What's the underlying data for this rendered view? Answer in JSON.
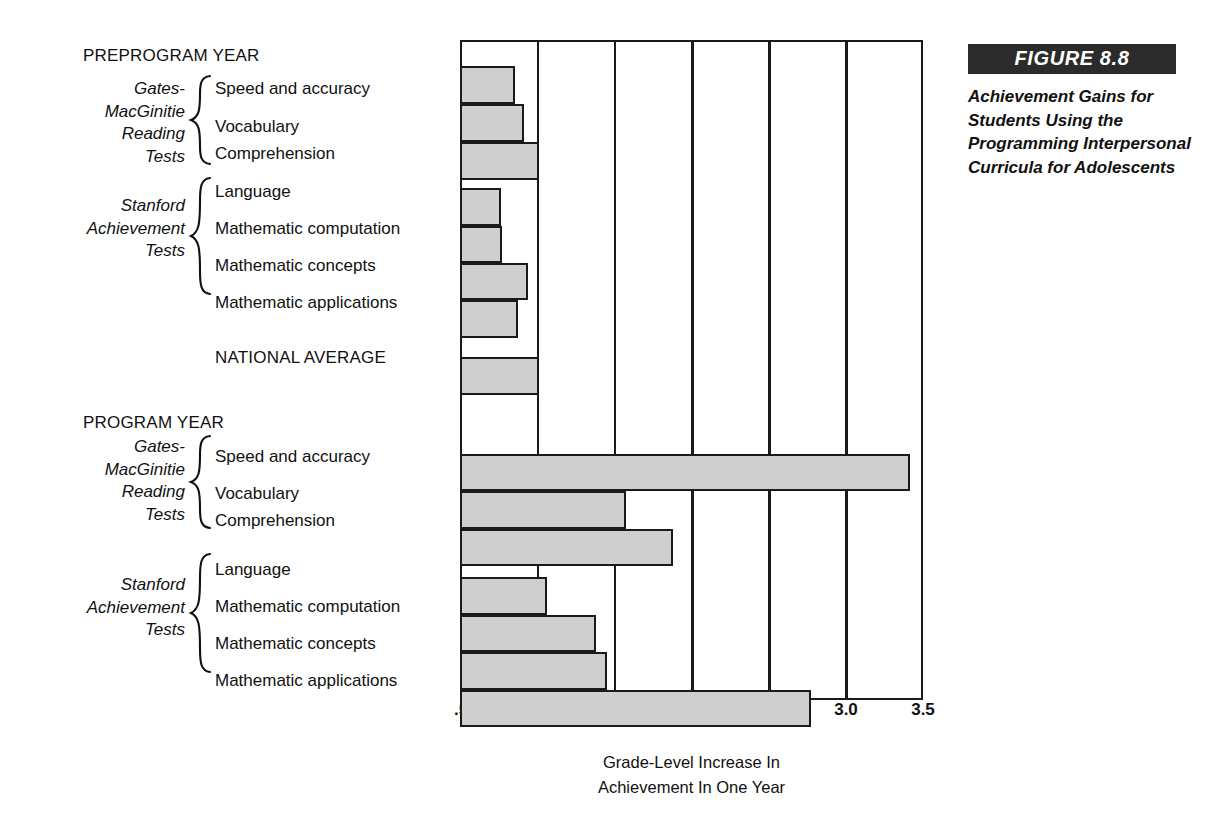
{
  "figure": {
    "number_label": "FIGURE 8.8",
    "caption": "Achievement Gains for Students Using the Programming Interpersonal Curricula for Adolescents"
  },
  "axis": {
    "title_line1": "Grade-Level Increase In",
    "title_line2": "Achievement In One Year",
    "ticks": [
      ".5",
      "1.0",
      "1.5",
      "2.0",
      "2.5",
      "3.0",
      "3.5"
    ]
  },
  "sections": {
    "preprogram_heading": "PREPROGRAM YEAR",
    "program_heading": "PROGRAM YEAR",
    "national_average_label": "NATIONAL AVERAGE"
  },
  "groups": {
    "gates": {
      "line1": "Gates-",
      "line2": "MacGinitie",
      "line3": "Reading",
      "line4": "Tests"
    },
    "stanford": {
      "line1": "Stanford",
      "line2": "Achievement",
      "line3": "Tests"
    }
  },
  "measures": {
    "speed": "Speed and accuracy",
    "vocabulary": "Vocabulary",
    "comprehension": "Comprehension",
    "language": "Language",
    "math_computation": "Mathematic computation",
    "math_concepts": "Mathematic concepts",
    "math_applications": "Mathematic applications"
  },
  "colors": {
    "bar_fill": "#cfcfcf",
    "bar_stroke": "#1a1a1a",
    "caption_bar_bg": "#2b2b2b",
    "caption_bar_text": "#ffffff"
  },
  "chart_data": {
    "type": "bar",
    "orientation": "horizontal",
    "title": "Achievement Gains for Students Using the Programming Interpersonal Curricula for Adolescents",
    "xlabel": "Grade-Level Increase In Achievement In One Year",
    "ylabel": "",
    "xlim": [
      0.5,
      3.5
    ],
    "xticks": [
      0.5,
      1.0,
      1.5,
      2.0,
      2.5,
      3.0,
      3.5
    ],
    "xtick_labels": [
      ".5",
      "1.0",
      "1.5",
      "2.0",
      "2.5",
      "3.0",
      "3.5"
    ],
    "grid": "vertical gridlines at every .5 unit",
    "legend": "none",
    "bar_base_value": 0.5,
    "reference_line": {
      "label": "NATIONAL AVERAGE",
      "value": 1.0
    },
    "groups": [
      {
        "section": "PREPROGRAM YEAR",
        "test_battery": "Gates-MacGinitie Reading Tests",
        "bars": [
          {
            "category": "Speed and accuracy",
            "value": 0.84
          },
          {
            "category": "Vocabulary",
            "value": 0.9
          },
          {
            "category": "Comprehension",
            "value": 1.0
          }
        ]
      },
      {
        "section": "PREPROGRAM YEAR",
        "test_battery": "Stanford Achievement Tests",
        "bars": [
          {
            "category": "Language",
            "value": 0.75
          },
          {
            "category": "Mathematic computation",
            "value": 0.76
          },
          {
            "category": "Mathematic concepts",
            "value": 0.93
          },
          {
            "category": "Mathematic applications",
            "value": 0.86
          }
        ]
      },
      {
        "section": "NATIONAL AVERAGE",
        "test_battery": "",
        "bars": [
          {
            "category": "NATIONAL AVERAGE",
            "value": 1.0
          }
        ]
      },
      {
        "section": "PROGRAM YEAR",
        "test_battery": "Gates-MacGinitie Reading Tests",
        "bars": [
          {
            "category": "Speed and accuracy",
            "value": 3.4
          },
          {
            "category": "Vocabulary",
            "value": 1.56
          },
          {
            "category": "Comprehension",
            "value": 1.87
          }
        ]
      },
      {
        "section": "PROGRAM YEAR",
        "test_battery": "Stanford Achievement Tests",
        "bars": [
          {
            "category": "Language",
            "value": 1.05
          },
          {
            "category": "Mathematic computation",
            "value": 1.37
          },
          {
            "category": "Mathematic concepts",
            "value": 1.44
          },
          {
            "category": "Mathematic applications",
            "value": 2.76
          }
        ]
      }
    ]
  }
}
